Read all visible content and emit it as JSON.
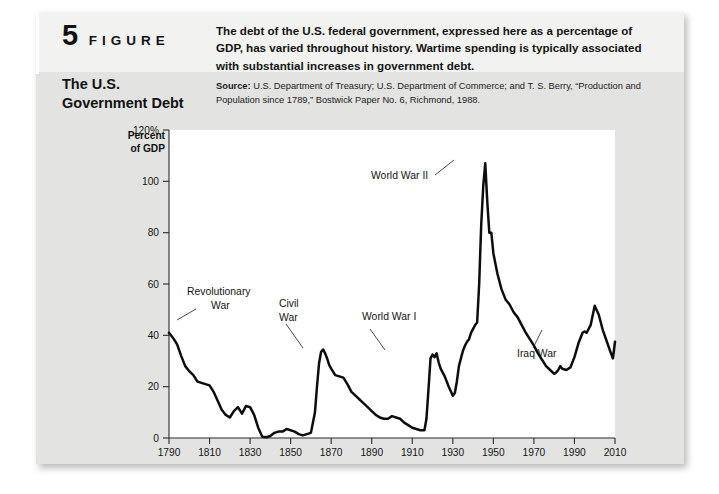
{
  "figure": {
    "number": "5",
    "word": "FIGURE",
    "title_line1": "The U.S.",
    "title_line2": "Government Debt",
    "caption": "The debt of the U.S. federal government, expressed here as a percentage of GDP, has varied throughout history. Wartime spending is typically associated with substantial increases in government debt.",
    "source_label": "Source:",
    "source_text": " U.S. Department of Treasury; U.S. Department of Commerce; and T. S. Berry, “Production and Population since 1789,” Bostwick Paper No. 6, Richmond, 1988."
  },
  "axis_title": {
    "line1": "Percent",
    "line2": "of GDP"
  },
  "colors": {
    "card_background": "#e3e3e1",
    "header_strip": "#f2f2f0",
    "plot_background": "#ffffff",
    "series_line": "#0d0d0d",
    "axis": "#2a2a2a",
    "text": "#121212"
  },
  "chart_data": {
    "type": "line",
    "title": "The U.S. Government Debt",
    "xlabel": "",
    "ylabel": "Percent of GDP",
    "xlim": [
      1790,
      2010
    ],
    "ylim": [
      0,
      120
    ],
    "xticks": [
      1790,
      1810,
      1830,
      1850,
      1870,
      1890,
      1910,
      1930,
      1950,
      1970,
      1990,
      2010
    ],
    "xtick_labels": [
      "1790",
      "1810",
      "1830",
      "1850",
      "1870",
      "1890",
      "1910",
      "1930",
      "1950",
      "1970",
      "1990",
      "2010"
    ],
    "yticks": [
      0,
      20,
      40,
      60,
      80,
      100,
      120
    ],
    "ytick_labels": [
      "0",
      "20",
      "40",
      "60",
      "80",
      "100",
      "120%"
    ],
    "grid": false,
    "legend": null,
    "series": [
      {
        "name": "Federal debt as percent of GDP",
        "x": [
          1790,
          1792,
          1794,
          1796,
          1798,
          1800,
          1802,
          1804,
          1806,
          1808,
          1810,
          1812,
          1814,
          1816,
          1818,
          1820,
          1822,
          1824,
          1826,
          1828,
          1830,
          1832,
          1834,
          1836,
          1838,
          1840,
          1842,
          1844,
          1846,
          1848,
          1850,
          1852,
          1854,
          1856,
          1858,
          1860,
          1862,
          1863,
          1864,
          1865,
          1866,
          1867,
          1868,
          1869,
          1870,
          1872,
          1874,
          1876,
          1878,
          1880,
          1882,
          1884,
          1886,
          1888,
          1890,
          1892,
          1894,
          1896,
          1898,
          1900,
          1902,
          1904,
          1906,
          1908,
          1910,
          1912,
          1914,
          1916,
          1917,
          1918,
          1919,
          1920,
          1921,
          1922,
          1923,
          1924,
          1926,
          1928,
          1930,
          1931,
          1932,
          1933,
          1934,
          1935,
          1936,
          1937,
          1938,
          1939,
          1940,
          1941,
          1942,
          1943,
          1944,
          1945,
          1946,
          1947,
          1948,
          1949,
          1950,
          1952,
          1954,
          1956,
          1958,
          1960,
          1962,
          1964,
          1966,
          1968,
          1970,
          1972,
          1974,
          1976,
          1978,
          1980,
          1981,
          1982,
          1983,
          1984,
          1986,
          1988,
          1990,
          1992,
          1994,
          1995,
          1996,
          1998,
          2000,
          2002,
          2004,
          2006,
          2008,
          2009,
          2010
        ],
        "y": [
          41.0,
          39.0,
          36.5,
          32.0,
          28.0,
          26.0,
          24.5,
          22.0,
          21.5,
          21.0,
          20.5,
          18.0,
          14.5,
          11.0,
          9.0,
          8.0,
          10.5,
          12.0,
          9.5,
          12.5,
          12.0,
          9.0,
          4.0,
          0.5,
          0.3,
          0.8,
          2.0,
          2.5,
          2.5,
          3.5,
          3.0,
          2.5,
          1.5,
          1.0,
          1.5,
          2.0,
          10.0,
          20.0,
          29.0,
          33.5,
          34.5,
          33.0,
          31.0,
          28.5,
          27.0,
          24.5,
          24.0,
          23.5,
          21.0,
          18.0,
          16.5,
          15.0,
          13.5,
          12.0,
          10.5,
          9.0,
          8.0,
          7.5,
          7.5,
          8.5,
          8.0,
          7.5,
          6.0,
          5.0,
          4.0,
          3.5,
          3.0,
          3.0,
          7.5,
          19.0,
          31.0,
          32.5,
          31.5,
          33.0,
          29.5,
          27.0,
          24.0,
          20.0,
          16.5,
          17.5,
          22.0,
          28.0,
          31.0,
          34.0,
          36.0,
          37.5,
          38.5,
          41.0,
          42.5,
          44.0,
          45.0,
          60.0,
          83.0,
          98.0,
          107.0,
          92.0,
          80.0,
          80.0,
          72.0,
          64.0,
          58.0,
          54.0,
          52.0,
          49.0,
          47.0,
          44.0,
          41.0,
          38.5,
          36.0,
          33.0,
          30.5,
          28.0,
          26.5,
          25.0,
          25.5,
          26.5,
          28.0,
          27.0,
          26.5,
          27.5,
          31.5,
          37.0,
          41.0,
          41.5,
          41.0,
          44.0,
          51.5,
          48.0,
          42.0,
          37.5,
          33.0,
          31.0,
          37.5
        ]
      }
    ],
    "annotations": [
      {
        "label": "Revolutionary",
        "label2": "War",
        "x": 1790,
        "y": 41.0,
        "note": "points to start of series"
      },
      {
        "label": "Civil",
        "label2": "War",
        "x": 1864,
        "y": 29.0,
        "note": "points to Civil War debt rise"
      },
      {
        "label": "World War I",
        "label2": "",
        "x": 1918,
        "y": 19.0,
        "note": "points to WWI debt rise"
      },
      {
        "label": "World War II",
        "label2": "",
        "x": 1946,
        "y": 107.0,
        "note": "points to WWII peak"
      },
      {
        "label": "Iraq War",
        "label2": "",
        "x": 2004,
        "y": 42.0,
        "note": "points to post-2003 debt rise"
      }
    ]
  }
}
